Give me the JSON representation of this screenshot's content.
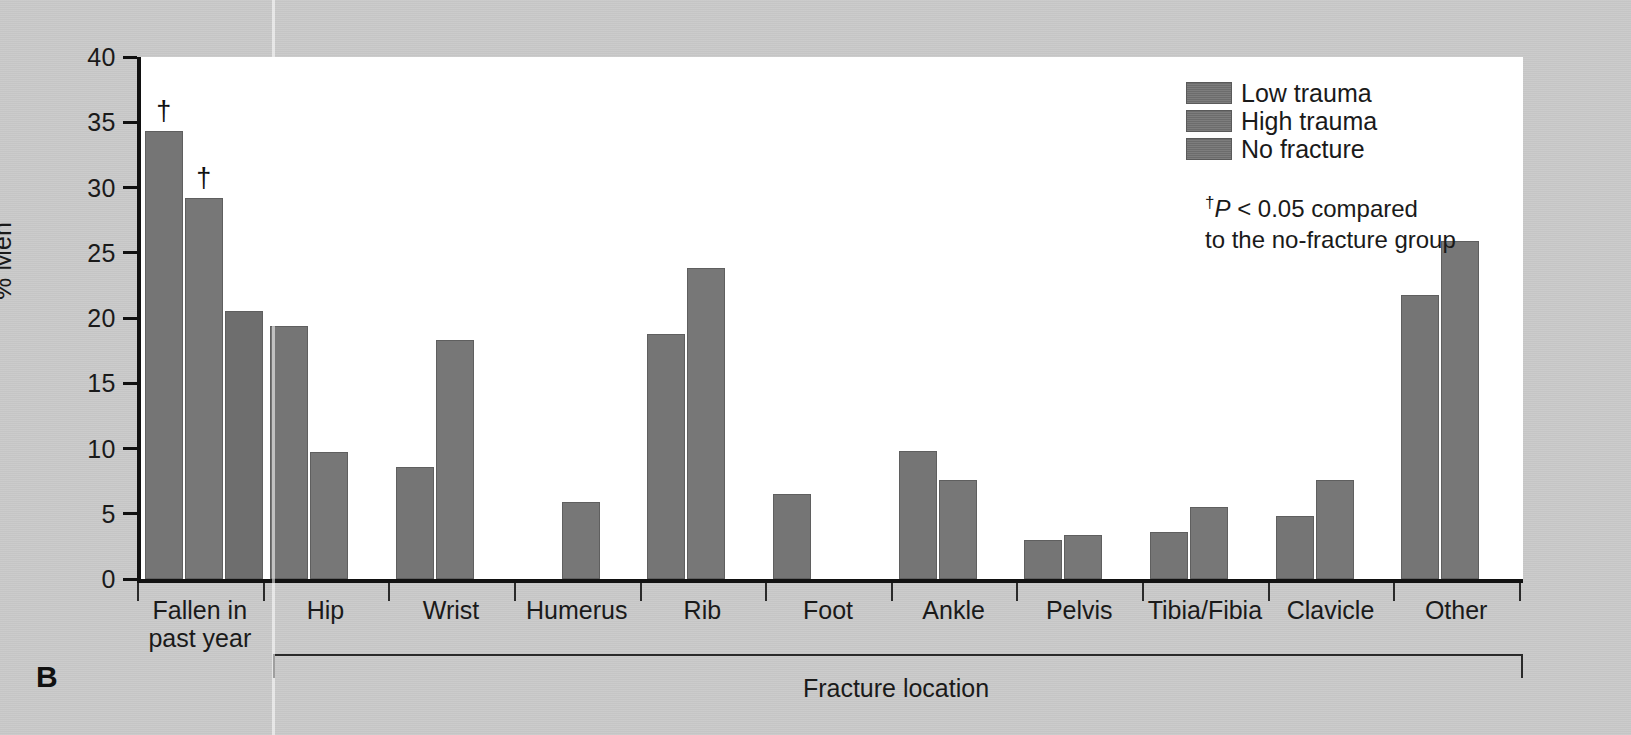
{
  "panel": {
    "letter": "B"
  },
  "axes": {
    "y_title": "% Men",
    "y_ticks": [
      "0",
      "5",
      "10",
      "15",
      "20",
      "25",
      "30",
      "35",
      "40"
    ],
    "x_group_label": "Fracture location"
  },
  "legend": {
    "items": [
      {
        "label": "Low trauma",
        "color": "#727272"
      },
      {
        "label": "High trauma",
        "color": "#727272"
      },
      {
        "label": "No fracture",
        "color": "#727272"
      }
    ]
  },
  "footnote": {
    "dagger": "†",
    "italic_p": "P",
    "rest": " < 0.05 compared",
    "line2": "to the no-fracture group"
  },
  "marker": {
    "significance": "†"
  },
  "chart_data": {
    "type": "bar",
    "title": "",
    "subtitle": "",
    "xlabel": "Fracture location",
    "ylabel": "% Men",
    "ylim": [
      0,
      40
    ],
    "yticks": [
      0,
      5,
      10,
      15,
      20,
      25,
      30,
      35,
      40
    ],
    "grid": false,
    "legend_position": "top-right",
    "categories": [
      "Fallen in\npast year",
      "Hip",
      "Wrist",
      "Humerus",
      "Rib",
      "Foot",
      "Ankle",
      "Pelvis",
      "Tibia/Fibia",
      "Clavicle",
      "Other"
    ],
    "series": [
      {
        "name": "Low trauma",
        "values": [
          34.3,
          19.4,
          8.6,
          null,
          18.8,
          6.5,
          9.8,
          3.0,
          3.6,
          4.8,
          21.8
        ]
      },
      {
        "name": "High trauma",
        "values": [
          29.2,
          9.7,
          18.3,
          5.9,
          23.8,
          null,
          7.6,
          3.4,
          5.5,
          7.6,
          25.9
        ]
      },
      {
        "name": "No fracture",
        "values": [
          20.5,
          null,
          null,
          null,
          null,
          null,
          null,
          null,
          null,
          null,
          null
        ]
      }
    ],
    "annotations": [
      {
        "category": "Fallen in\npast year",
        "series": "Low trauma",
        "marker": "†"
      },
      {
        "category": "Fallen in\npast year",
        "series": "High trauma",
        "marker": "†"
      }
    ],
    "footnote": "†P < 0.05 compared to the no-fracture group"
  }
}
